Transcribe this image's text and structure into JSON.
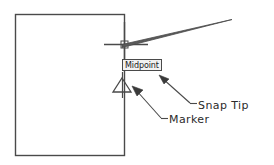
{
  "diagram": {
    "type": "cad-snap-diagram",
    "background_color": "#ffffff",
    "line_color": "#4a4a4a",
    "text_color": "#2b2b2b"
  },
  "shape": {
    "name": "rectangle",
    "stroke_color": "#4a4a4a",
    "x": 15,
    "y": 14,
    "width": 109,
    "height": 141
  },
  "cursor": {
    "name": "crosshair",
    "center_x": 124,
    "center_y": 44,
    "vertical_from_y": 22,
    "vertical_to_y": 61,
    "horizontal_from_x": 104,
    "horizontal_to_x": 148,
    "pickbox_size": 7,
    "stroke_color": "#4a4a4a"
  },
  "pointer": {
    "name": "leader-wedge",
    "tip_x": 232,
    "tip_y": 20,
    "base_x": 124,
    "base_y": 44,
    "stroke_color": "#4a4a4a"
  },
  "tooltip": {
    "label": "Midpoint",
    "border_color": "#4a4a4a",
    "background_color": "#f2f2f2",
    "text_color": "#1a1a1a",
    "x": 122,
    "y": 59,
    "width": 46,
    "height": 12
  },
  "marker": {
    "name": "midpoint-triangle-marker",
    "shape": "triangle",
    "center_x": 122,
    "apex_y": 78,
    "base_y": 92,
    "half_width": 9,
    "stroke_color": "#4a4a4a"
  },
  "annotations": [
    {
      "id": "snap-tip",
      "label": "Snap Tip",
      "text_x": 198,
      "text_y": 99,
      "leader": {
        "arrow_x": 160,
        "arrow_y": 76,
        "elbow_x": 190,
        "elbow_y": 103,
        "tail_x": 198,
        "tail_y": 103
      }
    },
    {
      "id": "marker",
      "label": "Marker",
      "text_x": 169,
      "text_y": 113,
      "leader": {
        "arrow_x": 133,
        "arrow_y": 88,
        "elbow_x": 160,
        "elbow_y": 118,
        "tail_x": 169,
        "tail_y": 118
      }
    }
  ]
}
